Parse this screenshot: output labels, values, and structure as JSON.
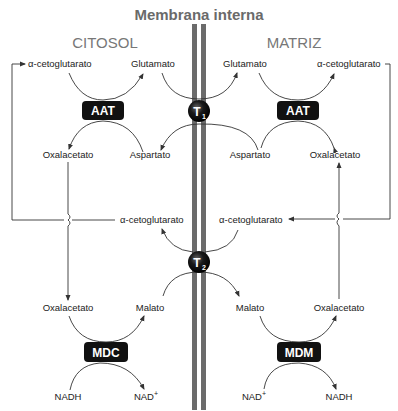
{
  "title": "Membrana interna",
  "regions": {
    "left": "CITOSOL",
    "right": "MATRIZ"
  },
  "transporters": {
    "t1": {
      "label": "T",
      "sub": "1"
    },
    "t2": {
      "label": "T",
      "sub": "2"
    }
  },
  "enzymes": {
    "aat_left": "AAT",
    "aat_right": "AAT",
    "mdc": "MDC",
    "mdm": "MDM"
  },
  "metabolites": {
    "cyt_akg_top": "α-cetoglutarato",
    "cyt_glutamato": "Glutamato",
    "cyt_oxalacetato_top": "Oxalacetato",
    "cyt_aspartato": "Aspartato",
    "cyt_akg_mid": "α-cetoglutarato",
    "cyt_oxalacetato_bottom": "Oxalacetato",
    "cyt_malato": "Malato",
    "cyt_nadh": "NADH",
    "cyt_nad": "NAD",
    "mat_glutamato": "Glutamato",
    "mat_akg_top": "α-cetoglutarato",
    "mat_aspartato": "Aspartato",
    "mat_oxalacetato_top": "Oxalacetato",
    "mat_akg_mid": "α-cetoglutarato",
    "mat_malato": "Malato",
    "mat_oxalacetato_bottom": "Oxalacetato",
    "mat_nad": "NAD",
    "mat_nadh": "NADH",
    "plus": "+"
  },
  "colors": {
    "membrane": "#6b6b6b",
    "enzyme_box": "#111111",
    "transporter": "#111111",
    "lines": "#333333"
  }
}
